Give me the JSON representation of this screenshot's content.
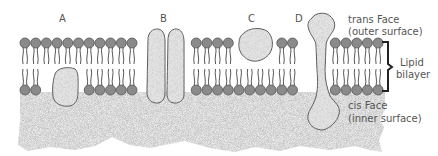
{
  "diagram": {
    "protein_labels": [
      {
        "id": "A",
        "label": "A",
        "x": 62,
        "y": 13
      },
      {
        "id": "B",
        "label": "B",
        "x": 162,
        "y": 13
      },
      {
        "id": "C",
        "label": "C",
        "x": 250,
        "y": 13
      },
      {
        "id": "D",
        "label": "D",
        "x": 297,
        "y": 13
      }
    ],
    "annotations": {
      "trans_face": "trans Face",
      "trans_face_sub": "(outer surface)",
      "lipid": "Lipid",
      "bilayer": "bilayer",
      "cis_face": "cis Face",
      "cis_face_sub": "(inner surface)"
    },
    "colors": {
      "head_fill": "#8a8a8a",
      "head_stroke": "#555555",
      "tail": "#444444",
      "protein_fill": "#e6e6e6",
      "protein_stroke": "#555555",
      "cytoplasm": "#d8d8d8",
      "text": "#555555"
    },
    "membrane": {
      "top_head_y": 43,
      "bottom_head_y": 90,
      "head_radius": 5,
      "head_spacing": 10.7,
      "x_start": 25,
      "x_end": 385
    }
  }
}
